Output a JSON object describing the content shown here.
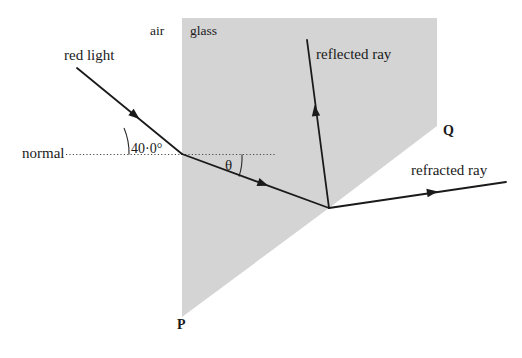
{
  "diagram": {
    "type": "optics-ray-diagram",
    "colors": {
      "glass_fill": "#d4d4d4",
      "ray_stroke": "#1a1a1a",
      "normal_stroke": "#555555",
      "background": "#ffffff",
      "text": "#1a1a1a"
    },
    "labels": {
      "air": "air",
      "glass": "glass",
      "red_light": "red light",
      "normal": "normal",
      "angle_of_incidence": "40·0°",
      "theta": "θ",
      "reflected_ray": "reflected ray",
      "refracted_ray": "refracted ray",
      "point_p": "P",
      "point_q": "Q"
    },
    "label_positions": {
      "air": {
        "x": 150,
        "y": 24
      },
      "glass": {
        "x": 190,
        "y": 24
      },
      "red_light": {
        "x": 64,
        "y": 48
      },
      "normal": {
        "x": 22,
        "y": 143
      },
      "angle_of_incidence": {
        "x": 130,
        "y": 141
      },
      "theta": {
        "x": 224,
        "y": 155
      },
      "reflected_ray": {
        "x": 316,
        "y": 46
      },
      "refracted_ray": {
        "x": 411,
        "y": 163
      },
      "point_p": {
        "x": 177,
        "y": 320
      },
      "point_q": {
        "x": 442,
        "y": 124
      }
    },
    "geometry": {
      "glass_polygon": "182,18 437,18 437,126 329,208 182,317",
      "incident_ray": {
        "x1": 77,
        "y1": 68,
        "x2": 182,
        "y2": 154
      },
      "incident_arrow_at": {
        "x": 128,
        "y": 110
      },
      "internal_ray": {
        "x1": 182,
        "y1": 154,
        "x2": 329,
        "y2": 208
      },
      "internal_arrow_at": {
        "x": 262,
        "y": 187
      },
      "reflected_ray": {
        "x1": 329,
        "y1": 208,
        "x2": 307,
        "y2": 40
      },
      "reflected_arrow_at": {
        "x": 317,
        "y": 115
      },
      "refracted_ray": {
        "x1": 329,
        "y1": 208,
        "x2": 506,
        "y2": 182
      },
      "refracted_arrow_at": {
        "x": 432,
        "y": 196
      },
      "normal_line_incidence": {
        "x1": 66,
        "y1": 154,
        "x2": 275,
        "y2": 154
      },
      "arc_incidence": {
        "cx": 182,
        "cy": 154,
        "r": 62
      },
      "arc_theta": {
        "cx": 182,
        "cy": 154,
        "r": 58
      }
    },
    "physics_values": {
      "angle_of_incidence_deg": 40.0,
      "angle_of_refraction_symbol": "θ",
      "medium_1": "air",
      "medium_2": "glass"
    }
  }
}
